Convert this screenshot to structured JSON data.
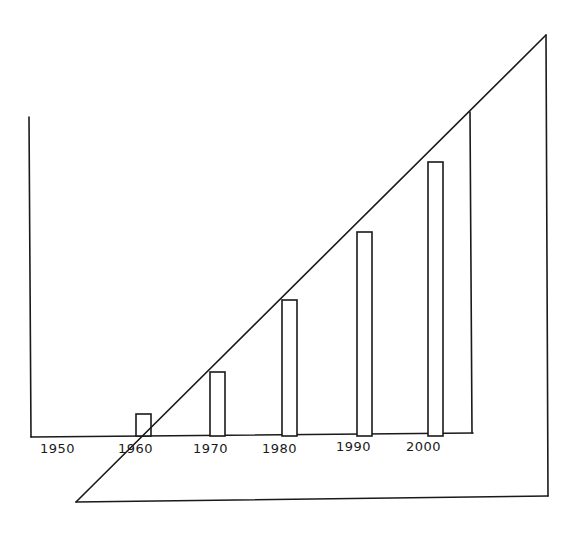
{
  "chart_data": {
    "type": "bar",
    "title": "",
    "xlabel": "",
    "ylabel": "",
    "categories": [
      "1950",
      "1960",
      "1970",
      "1980",
      "1990",
      "2000"
    ],
    "values": [
      0,
      22,
      64,
      136,
      204,
      274
    ],
    "value_units": "relative (pixel height, no y-axis scale shown)",
    "ylim": [
      0,
      320
    ],
    "grid": false,
    "legend": null,
    "annotations": [
      "Hand-drawn sketch: a large right triangle overlays the bars; its hypotenuse rises from lower-left to upper-right, roughly tracing the growth trend of the bars",
      "A vertical line rises from the x-axis near the right end (past 2000), meeting the hypotenuse"
    ]
  },
  "axis": {
    "x_ticks": [
      "1950",
      "1960",
      "1970",
      "1980",
      "1990",
      "2000"
    ]
  },
  "colors": {
    "ink": "#1a1a1a",
    "background": "#ffffff"
  }
}
